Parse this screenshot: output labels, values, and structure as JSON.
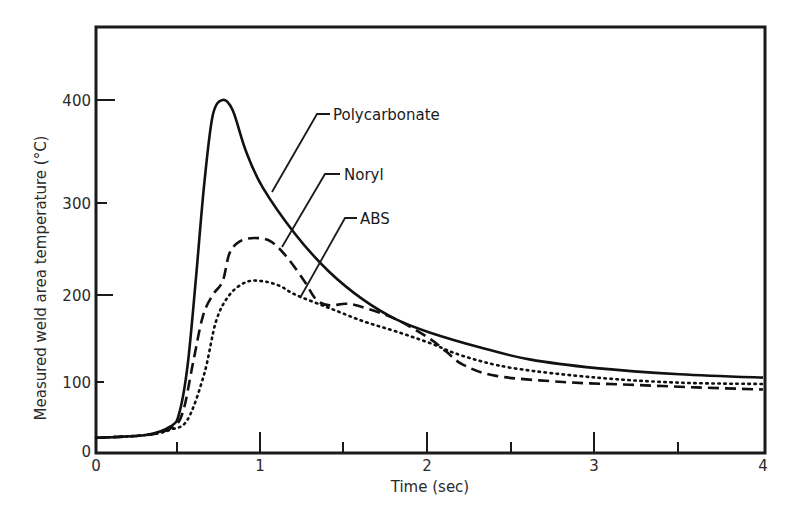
{
  "chart_data": {
    "type": "line",
    "title": "",
    "xlabel": "Time (sec)",
    "ylabel": "Measured weld area temperature (°C)",
    "xlim": [
      0,
      4
    ],
    "ylim": [
      0,
      460
    ],
    "x_ticks": [
      0,
      1,
      2,
      3,
      4
    ],
    "x_tick_labels": [
      "0",
      "1",
      "2",
      "3",
      "4"
    ],
    "x_minor_ticks": [
      0.5,
      1.5,
      2.5,
      3.5
    ],
    "y_ticks": [
      0,
      100,
      200,
      300,
      400
    ],
    "y_tick_labels": [
      "0",
      "100",
      "200",
      "300",
      "400"
    ],
    "grid": false,
    "legend": "inline leader-line labels",
    "series": [
      {
        "name": "Polycarbonate",
        "style": "solid",
        "points": [
          [
            0,
            18
          ],
          [
            0.3,
            22
          ],
          [
            0.45,
            35
          ],
          [
            0.5,
            55
          ],
          [
            0.55,
            120
          ],
          [
            0.6,
            220
          ],
          [
            0.65,
            320
          ],
          [
            0.7,
            385
          ],
          [
            0.76,
            400
          ],
          [
            0.82,
            390
          ],
          [
            0.9,
            350
          ],
          [
            1.0,
            315
          ],
          [
            1.2,
            265
          ],
          [
            1.4,
            225
          ],
          [
            1.6,
            195
          ],
          [
            1.8,
            172
          ],
          [
            2.0,
            157
          ],
          [
            2.3,
            140
          ],
          [
            2.6,
            126
          ],
          [
            3.0,
            116
          ],
          [
            3.5,
            109
          ],
          [
            4.0,
            105
          ]
        ]
      },
      {
        "name": "Noryl",
        "style": "dashed",
        "points": [
          [
            0,
            18
          ],
          [
            0.3,
            22
          ],
          [
            0.45,
            32
          ],
          [
            0.52,
            55
          ],
          [
            0.58,
            120
          ],
          [
            0.64,
            175
          ],
          [
            0.7,
            200
          ],
          [
            0.76,
            215
          ],
          [
            0.8,
            245
          ],
          [
            0.86,
            258
          ],
          [
            0.95,
            262
          ],
          [
            1.05,
            258
          ],
          [
            1.15,
            240
          ],
          [
            1.25,
            215
          ],
          [
            1.32,
            195
          ],
          [
            1.4,
            188
          ],
          [
            1.5,
            190
          ],
          [
            1.6,
            186
          ],
          [
            1.8,
            172
          ],
          [
            2.0,
            150
          ],
          [
            2.1,
            135
          ],
          [
            2.2,
            120
          ],
          [
            2.4,
            107
          ],
          [
            2.8,
            100
          ],
          [
            3.2,
            96
          ],
          [
            3.6,
            92
          ],
          [
            4.0,
            89
          ]
        ]
      },
      {
        "name": "ABS",
        "style": "dotted",
        "points": [
          [
            0,
            18
          ],
          [
            0.3,
            22
          ],
          [
            0.45,
            30
          ],
          [
            0.55,
            45
          ],
          [
            0.65,
            110
          ],
          [
            0.72,
            170
          ],
          [
            0.8,
            200
          ],
          [
            0.9,
            214
          ],
          [
            1.0,
            215
          ],
          [
            1.1,
            210
          ],
          [
            1.2,
            200
          ],
          [
            1.4,
            185
          ],
          [
            1.6,
            170
          ],
          [
            1.8,
            158
          ],
          [
            2.0,
            145
          ],
          [
            2.2,
            130
          ],
          [
            2.5,
            116
          ],
          [
            3.0,
            105
          ],
          [
            3.5,
            99
          ],
          [
            4.0,
            97
          ]
        ]
      }
    ],
    "annotations": [
      {
        "text": "Polycarbonate",
        "points_to": [
          1.1,
          290
        ]
      },
      {
        "text": "Noryl",
        "points_to": [
          1.15,
          240
        ]
      },
      {
        "text": "ABS",
        "points_to": [
          1.27,
          190
        ]
      }
    ]
  },
  "labels": {
    "xlabel": "Time (sec)",
    "ylabel": "Measured weld area temperature (°C)",
    "series_pc": "Polycarbonate",
    "series_noryl": "Noryl",
    "series_abs": "ABS",
    "x0": "0",
    "x1": "1",
    "x2": "2",
    "x3": "3",
    "x4": "4",
    "y0": "0",
    "y100": "100",
    "y200": "200",
    "y300": "300",
    "y400": "400"
  }
}
